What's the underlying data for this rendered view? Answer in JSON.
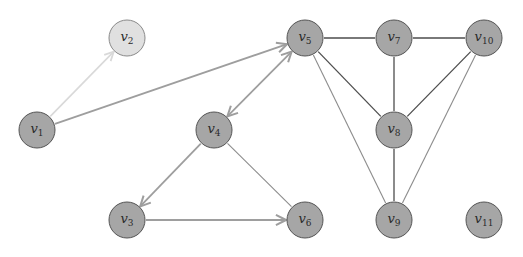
{
  "colors": {
    "node_fill": "#a6a6a6",
    "node_fill_light": "#e0e0e0",
    "node_stroke": "#555555",
    "node_stroke_light": "#8a8a8a",
    "edge_dark": "#4d4d4d",
    "edge_gray": "#9e9e9e",
    "edge_light": "#d9d9d9",
    "edge_mid": "#8c8c8c"
  },
  "nodes": [
    {
      "id": "v1",
      "base": "v",
      "sub": "1",
      "style": "normal"
    },
    {
      "id": "v2",
      "base": "v",
      "sub": "2",
      "style": "light"
    },
    {
      "id": "v3",
      "base": "v",
      "sub": "3",
      "style": "normal"
    },
    {
      "id": "v4",
      "base": "v",
      "sub": "4",
      "style": "normal"
    },
    {
      "id": "v5",
      "base": "v",
      "sub": "5",
      "style": "normal"
    },
    {
      "id": "v6",
      "base": "v",
      "sub": "6",
      "style": "normal"
    },
    {
      "id": "v7",
      "base": "v",
      "sub": "7",
      "style": "normal"
    },
    {
      "id": "v8",
      "base": "v",
      "sub": "8",
      "style": "normal"
    },
    {
      "id": "v9",
      "base": "v",
      "sub": "9",
      "style": "normal"
    },
    {
      "id": "v10",
      "base": "v",
      "sub": "10",
      "style": "normal"
    },
    {
      "id": "v11",
      "base": "v",
      "sub": "11",
      "style": "normal"
    }
  ],
  "edges": [
    {
      "from": "v1",
      "to": "v2",
      "directed": "forward",
      "style": "light"
    },
    {
      "from": "v1",
      "to": "v5",
      "directed": "forward",
      "style": "gray"
    },
    {
      "from": "v5",
      "to": "v4",
      "directed": "both",
      "style": "gray"
    },
    {
      "from": "v4",
      "to": "v3",
      "directed": "forward",
      "style": "gray"
    },
    {
      "from": "v3",
      "to": "v6",
      "directed": "forward",
      "style": "gray"
    },
    {
      "from": "v4",
      "to": "v6",
      "directed": "none",
      "style": "mid"
    },
    {
      "from": "v5",
      "to": "v7",
      "directed": "none",
      "style": "dark"
    },
    {
      "from": "v7",
      "to": "v10",
      "directed": "none",
      "style": "dark"
    },
    {
      "from": "v7",
      "to": "v8",
      "directed": "none",
      "style": "dark"
    },
    {
      "from": "v5",
      "to": "v8",
      "directed": "none",
      "style": "dark"
    },
    {
      "from": "v5",
      "to": "v9",
      "directed": "none",
      "style": "mid"
    },
    {
      "from": "v8",
      "to": "v9",
      "directed": "none",
      "style": "dark"
    },
    {
      "from": "v10",
      "to": "v8",
      "directed": "none",
      "style": "dark"
    },
    {
      "from": "v10",
      "to": "v9",
      "directed": "none",
      "style": "mid"
    }
  ]
}
